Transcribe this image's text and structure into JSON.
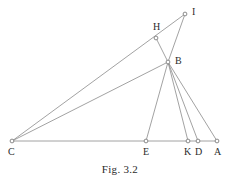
{
  "figure": {
    "caption": "Fig. 3.2",
    "line_color": "#8a8a8a",
    "point_stroke_color": "#6f6f6f",
    "point_fill_color": "#ffffff",
    "label_color": "#2b2b2b",
    "background_color": "#ffffff",
    "width": 240,
    "height": 182
  },
  "points": [
    {
      "name": "I",
      "label": "I",
      "x": 185,
      "y": 14,
      "label_x": 192,
      "label_y": 7
    },
    {
      "name": "H",
      "label": "H",
      "x": 156,
      "y": 38,
      "label_x": 153,
      "label_y": 22
    },
    {
      "name": "B",
      "label": "B",
      "x": 168,
      "y": 62,
      "label_x": 175,
      "label_y": 56
    },
    {
      "name": "C",
      "label": "C",
      "x": 12,
      "y": 141,
      "label_x": 8,
      "label_y": 147
    },
    {
      "name": "E",
      "label": "E",
      "x": 146,
      "y": 141,
      "label_x": 143,
      "label_y": 147
    },
    {
      "name": "K",
      "label": "K",
      "x": 188,
      "y": 141,
      "label_x": 184,
      "label_y": 147
    },
    {
      "name": "D",
      "label": "D",
      "x": 198,
      "y": 141,
      "label_x": 195,
      "label_y": 147
    },
    {
      "name": "A",
      "label": "A",
      "x": 217,
      "y": 141,
      "label_x": 214,
      "label_y": 147
    }
  ],
  "segments": [
    {
      "name": "segment-C-A",
      "from": "C",
      "to": "A"
    },
    {
      "name": "segment-C-B",
      "from": "C",
      "to": "B"
    },
    {
      "name": "segment-C-I",
      "from": "C",
      "to": "I"
    },
    {
      "name": "segment-H-B",
      "from": "H",
      "to": "B"
    },
    {
      "name": "segment-I-B",
      "from": "I",
      "to": "B"
    },
    {
      "name": "segment-B-E",
      "from": "B",
      "to": "E"
    },
    {
      "name": "segment-B-K",
      "from": "B",
      "to": "K"
    },
    {
      "name": "segment-B-D",
      "from": "B",
      "to": "D"
    },
    {
      "name": "segment-B-A",
      "from": "B",
      "to": "A"
    }
  ]
}
